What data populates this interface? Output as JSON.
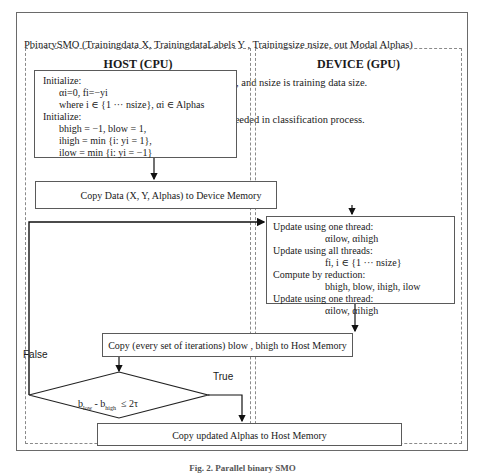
{
  "header": {
    "signature": "PbinarySMO (Trainingdata X, TrainingdataLabels Y , Trainingsize nsize, out Modal Alphas)",
    "input": "Input:   X is training dataset, Y its labels class, and nsize is training data size.",
    "output": "Output: Alphas are updated parameters was needed in classification process."
  },
  "lanes": {
    "host": {
      "title": "HOST (CPU)"
    },
    "device": {
      "title": "DEVICE (GPU)"
    }
  },
  "init_box": {
    "lines": [
      {
        "text": "Initialize:",
        "indent": false
      },
      {
        "text": "αi=0, fi=−yi",
        "indent": true
      },
      {
        "text": "where i ∈ {1 ··· nsize}, αi ∈ Alphas",
        "indent": true
      },
      {
        "text": "Initialize:",
        "indent": false
      },
      {
        "text": "bhigh = −1, blow = 1,",
        "indent": true
      },
      {
        "text": "ihigh = min {i: yi = 1},",
        "indent": true
      },
      {
        "text": "ilow = min {i: yi = −1}",
        "indent": true
      }
    ]
  },
  "copy_to_device": "Copy Data (X, Y, Alphas) to Device Memory",
  "device_box": {
    "lines": [
      {
        "text": "Update using one thread:",
        "indent": false
      },
      {
        "text": "αilow, αihigh",
        "indent": true
      },
      {
        "text": "Update using all threads:",
        "indent": false
      },
      {
        "text": "fi, i ∈ {1 ··· nsize}",
        "indent": true
      },
      {
        "text": "Compute by reduction:",
        "indent": false
      },
      {
        "text": "bhigh, blow, ihigh, ilow",
        "indent": true
      },
      {
        "text": "Update using one thread:",
        "indent": false
      },
      {
        "text": "αilow, αihigh",
        "indent": true
      }
    ]
  },
  "copy_to_host": "Copy (every set of iterations) blow , bhigh to Host Memory",
  "decision": {
    "b": "b",
    "low": "low",
    "minus": " - b",
    "high": "high",
    "rest": "  ≤ 2τ",
    "true_label": "True",
    "false_label": "False"
  },
  "final_copy": "Copy updated Alphas to Host Memory",
  "caption": "Fig. 2.  Parallel binary SMO"
}
